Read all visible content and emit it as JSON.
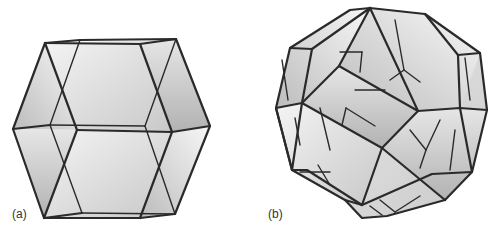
{
  "figure": {
    "panels": [
      {
        "id": "a",
        "label": "(a)",
        "subject": "rhombic-dodecahedron-like polyhedron (elongated, 12 faces)"
      },
      {
        "id": "b",
        "label": "(b)",
        "subject": "rhombic triacontahedron-like polyhedron"
      }
    ],
    "colors": {
      "edge": "#2a2a2a",
      "face_light": "#f2f2f2",
      "face_mid": "#d9d9d9",
      "face_dark": "#bdbdbd",
      "background": "#ffffff"
    }
  }
}
